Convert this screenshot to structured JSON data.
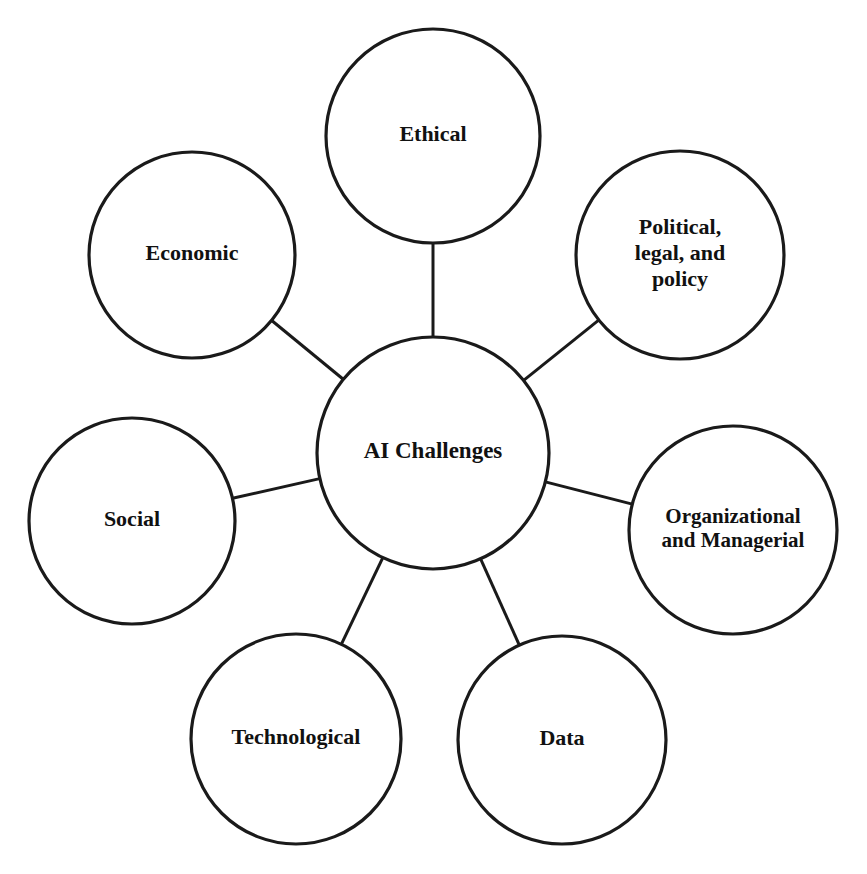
{
  "diagram": {
    "title": "AI Challenges",
    "type": "hub-and-spoke concept map",
    "canvas": {
      "width": 867,
      "height": 874,
      "background": "#ffffff"
    },
    "style": {
      "stroke_color": "#1a1a1a",
      "fill_color": "#ffffff",
      "circle_stroke_width": 3.2,
      "connector_stroke_width": 3.0,
      "text_color": "#111111"
    },
    "center": {
      "id": "center",
      "label": "AI Challenges",
      "lines": [
        "AI Challenges"
      ],
      "cx": 433,
      "cy": 453,
      "r": 116,
      "font_size": 23
    },
    "nodes": [
      {
        "id": "ethical",
        "label": "Ethical",
        "lines": [
          "Ethical"
        ],
        "cx": 433,
        "cy": 136,
        "r": 107,
        "font_size": 22,
        "position": "top"
      },
      {
        "id": "political-legal-policy",
        "label": "Political, legal, and policy",
        "lines": [
          "Political,",
          "legal, and",
          "policy"
        ],
        "cx": 680,
        "cy": 255,
        "r": 104,
        "font_size": 22,
        "position": "top-right"
      },
      {
        "id": "organizational-managerial",
        "label": "Organizational and Managerial",
        "lines": [
          "Organizational",
          "and Managerial"
        ],
        "cx": 733,
        "cy": 530,
        "r": 104,
        "font_size": 21,
        "position": "right"
      },
      {
        "id": "data",
        "label": "Data",
        "lines": [
          "Data"
        ],
        "cx": 562,
        "cy": 740,
        "r": 104,
        "font_size": 22,
        "position": "bottom-right"
      },
      {
        "id": "technological",
        "label": "Technological",
        "lines": [
          "Technological"
        ],
        "cx": 296,
        "cy": 739,
        "r": 105,
        "font_size": 22,
        "position": "bottom-left"
      },
      {
        "id": "social",
        "label": "Social",
        "lines": [
          "Social"
        ],
        "cx": 132,
        "cy": 521,
        "r": 103,
        "font_size": 22,
        "position": "left"
      },
      {
        "id": "economic",
        "label": "Economic",
        "lines": [
          "Economic"
        ],
        "cx": 192,
        "cy": 255,
        "r": 103,
        "font_size": 22,
        "position": "top-left"
      }
    ],
    "connections": [
      {
        "from": "center",
        "to": "ethical"
      },
      {
        "from": "center",
        "to": "political-legal-policy"
      },
      {
        "from": "center",
        "to": "organizational-managerial"
      },
      {
        "from": "center",
        "to": "data"
      },
      {
        "from": "center",
        "to": "technological"
      },
      {
        "from": "center",
        "to": "social"
      },
      {
        "from": "center",
        "to": "economic"
      }
    ]
  }
}
